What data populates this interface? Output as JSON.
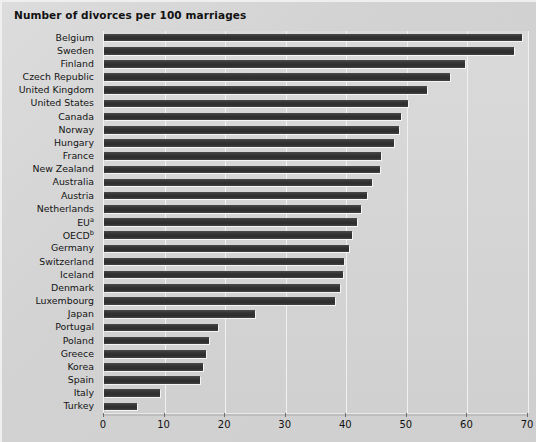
{
  "chart_data": {
    "type": "bar",
    "orientation": "horizontal",
    "title": "Number of divorces per 100 marriages",
    "xlabel": "",
    "ylabel": "",
    "xlim": [
      0,
      70
    ],
    "xticks": [
      0,
      10,
      20,
      30,
      40,
      50,
      60,
      70
    ],
    "grid": true,
    "legend": null,
    "categories": [
      "Belgium",
      "Sweden",
      "Finland",
      "Czech Republic",
      "United Kingdom",
      "United States",
      "Canada",
      "Norway",
      "Hungary",
      "France",
      "New Zealand",
      "Australia",
      "Austria",
      "Netherlands",
      "EU",
      "OECD",
      "Germany",
      "Switzerland",
      "Iceland",
      "Denmark",
      "Luxembourg",
      "Japan",
      "Portugal",
      "Poland",
      "Greece",
      "Korea",
      "Spain",
      "Italy",
      "Turkey"
    ],
    "category_footnotes": {
      "EU": "a",
      "OECD": "b"
    },
    "values": [
      69.0,
      67.7,
      59.6,
      57.1,
      53.3,
      50.2,
      49.0,
      48.7,
      47.8,
      45.8,
      45.5,
      44.3,
      43.4,
      42.4,
      41.7,
      41.0,
      40.4,
      39.7,
      39.4,
      39.0,
      38.2,
      25.0,
      18.9,
      17.4,
      16.9,
      16.4,
      15.9,
      9.3,
      5.5
    ]
  },
  "colors": {
    "background": "#d6d6d6",
    "plot_background": "#d5d5d5",
    "bar": "#333333",
    "gridline": "#f1f1f1",
    "text": "#111111"
  }
}
